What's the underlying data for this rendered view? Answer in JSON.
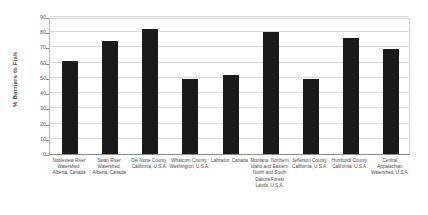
{
  "chart_data": {
    "type": "bar",
    "title": "",
    "xlabel": "",
    "ylabel": "% Barriers to Fish",
    "ylim": [
      0,
      90
    ],
    "ytick_interval": 10,
    "yticks": [
      0,
      10,
      20,
      30,
      40,
      50,
      60,
      70,
      80,
      90
    ],
    "grid": true,
    "legend": "none",
    "bar_color": "#1a1a1a",
    "categories": [
      "Nobleview River Watershed, Alberta, Canada",
      "Swan River Watershed, Alberta, Canada",
      "Del Norte County, California, U.S.A.",
      "Whatcom County, Washington, U.S.A.",
      "Labrador, Canada",
      "Montana, Northern Idaho and Eastern North and South Dakota Forest Lands, U.S.A.",
      "Jefferson County, California, U.S.A.",
      "Humboldt County, California, U.S.A.",
      "Central Appalachian Watershed, U.S.A."
    ],
    "values": [
      61,
      74,
      82,
      49,
      52,
      80,
      49,
      76,
      69
    ]
  }
}
